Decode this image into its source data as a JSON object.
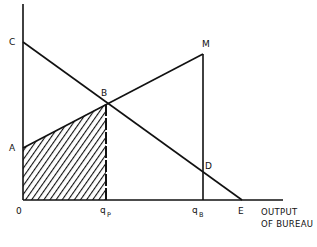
{
  "diagram": {
    "type": "economics-bureau-output",
    "colors": {
      "line": "#111111",
      "background": "#ffffff",
      "hatch": "#111111"
    },
    "points": {
      "O": {
        "label": "0",
        "x": 23,
        "y": 200
      },
      "A": {
        "label": "A",
        "x": 23,
        "y": 148
      },
      "C": {
        "label": "C",
        "x": 23,
        "y": 42
      },
      "B": {
        "label": "B",
        "x": 106,
        "y": 104
      },
      "M": {
        "label": "M",
        "x": 203,
        "y": 54
      },
      "D": {
        "label": "D",
        "x": 203,
        "y": 170
      },
      "E": {
        "label": "E",
        "x": 242,
        "y": 200
      }
    },
    "axis_ticks": {
      "qp": {
        "main": "q",
        "sub": "P",
        "x": 106
      },
      "qb": {
        "main": "q",
        "sub": "B",
        "x": 203
      }
    },
    "x_axis_label": {
      "line1": "OUTPUT",
      "line2": "OF BUREAU"
    },
    "lines": [
      {
        "name": "demand-line-CE",
        "from": "C",
        "to": "E"
      },
      {
        "name": "cost-line-AM",
        "from": "A",
        "to": "M"
      },
      {
        "name": "vertical-qb-line",
        "from": "M",
        "to": "qB"
      },
      {
        "name": "dashed-qp-line",
        "from": "B",
        "to": "qP",
        "style": "dashed"
      }
    ],
    "shaded_region": {
      "name": "hatched-area-0ABqp",
      "vertices": [
        "O",
        "A",
        "B",
        "qP"
      ]
    }
  }
}
